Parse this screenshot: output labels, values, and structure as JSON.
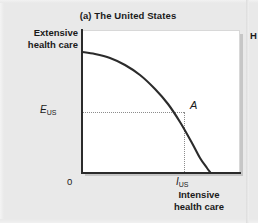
{
  "figure": {
    "panel_title": "(a) The United States",
    "origin_label": "0",
    "y_axis_label_line1": "Extensive",
    "y_axis_label_line2": "health care",
    "x_axis_label_line1": "Intensive",
    "x_axis_label_line2": "health care",
    "y_tick_symbol": "E",
    "y_tick_subscript": "US",
    "x_tick_symbol": "I",
    "x_tick_subscript": "US",
    "point_label": "A",
    "neighbor_panel_letter": "H",
    "colors": {
      "background": "#e9e9e9",
      "plot_background": "#ffffff",
      "axis": "#2b2b2b",
      "curve": "#2b2b2b",
      "guide_line": "#8c8c8c",
      "text": "#1a1a1a"
    }
  },
  "chart_data": {
    "type": "line",
    "title": "(a) The United States",
    "xlabel": "Intensive health care",
    "ylabel": "Extensive health care",
    "curve_name": "Production possibilities frontier",
    "curve_shape": "concave-to-origin",
    "x_intercept_px": 210,
    "y_intercept_px": 52,
    "xlim": [
      0,
      1
    ],
    "ylim": [
      0,
      1
    ],
    "grid": false,
    "legend": false,
    "tick_labels": {
      "x": [
        "0",
        "I_US"
      ],
      "y": [
        "E_US"
      ]
    },
    "annotations": [
      {
        "label": "A",
        "description": "Chosen point on the frontier for the United States",
        "x_px": 184,
        "y_px": 112
      }
    ],
    "series": [
      {
        "name": "PPF",
        "points_px": [
          [
            82,
            52
          ],
          [
            95,
            54
          ],
          [
            110,
            58
          ],
          [
            125,
            65
          ],
          [
            140,
            75
          ],
          [
            155,
            89
          ],
          [
            168,
            104
          ],
          [
            180,
            122
          ],
          [
            192,
            143
          ],
          [
            200,
            158
          ],
          [
            207,
            168
          ],
          [
            210,
            172
          ]
        ]
      }
    ],
    "guide_lines": [
      {
        "orientation": "horizontal",
        "from_px": [
          83,
          112
        ],
        "to_px": [
          184,
          112
        ],
        "style": "dotted"
      },
      {
        "orientation": "vertical",
        "from_px": [
          184,
          112
        ],
        "to_px": [
          184,
          172
        ],
        "style": "dotted"
      }
    ]
  }
}
